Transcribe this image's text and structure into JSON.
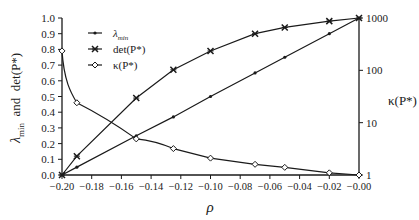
{
  "chart_data": {
    "type": "line",
    "title": "",
    "xlabel": "ρ",
    "ylabel_left": "λmin and det(P*)",
    "ylabel_right": "κ(P*)",
    "xlim": [
      -0.2,
      0.0
    ],
    "ylim_left": [
      0.0,
      1.0
    ],
    "ylim_right": [
      1,
      1000
    ],
    "right_scale": "log",
    "grid": false,
    "legend_position": "upper left",
    "x_ticks": [
      "-0.20",
      "-0.18",
      "-0.16",
      "-0.14",
      "-0.12",
      "-0.10",
      "-0.08",
      "-0.06",
      "-0.04",
      "-0.02",
      "-0.00"
    ],
    "y_left_ticks": [
      "0.0",
      "0.1",
      "0.2",
      "0.3",
      "0.4",
      "0.5",
      "0.6",
      "0.7",
      "0.8",
      "0.9",
      "1.0"
    ],
    "y_right_ticks": [
      "1",
      "10",
      "100",
      "1000"
    ],
    "x": [
      -0.2,
      -0.19,
      -0.15,
      -0.125,
      -0.1,
      -0.07,
      -0.05,
      -0.02,
      0.0
    ],
    "series": [
      {
        "name": "λmin",
        "marker": "dot",
        "axis": "left",
        "values": [
          0.0,
          0.05,
          0.25,
          0.37,
          0.5,
          0.65,
          0.75,
          0.9,
          1.0
        ]
      },
      {
        "name": "det(P*)",
        "marker": "x",
        "axis": "left",
        "values": [
          0.0,
          0.12,
          0.49,
          0.67,
          0.79,
          0.9,
          0.94,
          0.98,
          1.0
        ]
      },
      {
        "name": "κ(P*)",
        "marker": "diamond",
        "axis": "right",
        "values": [
          235,
          24,
          4.9,
          3.2,
          2.1,
          1.6,
          1.4,
          1.1,
          1.0
        ]
      }
    ]
  },
  "legend": {
    "items": [
      {
        "label": "λ",
        "sub": "min"
      },
      {
        "label": "det(P*)"
      },
      {
        "label": "κ(P*)"
      }
    ]
  },
  "axes": {
    "xlabel": "ρ",
    "ylabel_left_main": "λ",
    "ylabel_left_sub": "min",
    "ylabel_left_rest": "  and  det(P*)",
    "ylabel_right": "κ(P*)"
  }
}
